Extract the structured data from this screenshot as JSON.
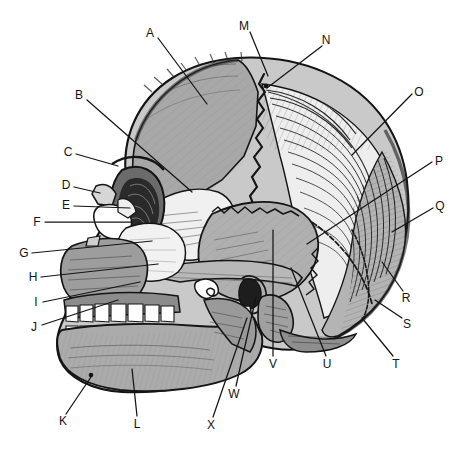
{
  "figure": {
    "background_color": "#ffffff",
    "line_color": "#141414",
    "label_font_size_px": 12,
    "palette": {
      "outline": "#141414",
      "dark_shade": "#6e6e6e",
      "mid_shade": "#a3a3a3",
      "light_shade": "#d8d8d8",
      "bone_white": "#f2f2f2",
      "tooth_white": "#ffffff",
      "cavity_black": "#1a1a1a"
    }
  },
  "labels": [
    {
      "id": "A",
      "text": "A",
      "x": 150,
      "y": 33,
      "tip_x": 207,
      "tip_y": 104,
      "side": "top-left",
      "part": "frontal-bone"
    },
    {
      "id": "B",
      "text": "B",
      "x": 79,
      "y": 95,
      "tip_x": 192,
      "tip_y": 192,
      "side": "left",
      "part": "sphenoid-greater-wing"
    },
    {
      "id": "C",
      "text": "C",
      "x": 68,
      "y": 152,
      "tip_x": 118,
      "tip_y": 166,
      "side": "left",
      "part": "supraorbital-margin"
    },
    {
      "id": "D",
      "text": "D",
      "x": 66,
      "y": 185,
      "tip_x": 100,
      "tip_y": 193,
      "side": "left",
      "part": "nasal-bone"
    },
    {
      "id": "E",
      "text": "E",
      "x": 66,
      "y": 205,
      "tip_x": 130,
      "tip_y": 208,
      "side": "left",
      "part": "lacrimal-bone"
    },
    {
      "id": "F",
      "text": "F",
      "x": 37,
      "y": 222,
      "tip_x": 131,
      "tip_y": 222,
      "side": "left",
      "part": "ethmoid-bone"
    },
    {
      "id": "G",
      "text": "G",
      "x": 24,
      "y": 253,
      "tip_x": 152,
      "tip_y": 241,
      "side": "left",
      "part": "anterior-nasal-spine"
    },
    {
      "id": "H",
      "text": "H",
      "x": 33,
      "y": 277,
      "tip_x": 158,
      "tip_y": 264,
      "side": "left",
      "part": "zygomatic-bone"
    },
    {
      "id": "I",
      "text": "I",
      "x": 36,
      "y": 302,
      "tip_x": 140,
      "tip_y": 282,
      "side": "left",
      "part": "maxilla"
    },
    {
      "id": "J",
      "text": "J",
      "x": 34,
      "y": 327,
      "tip_x": 118,
      "tip_y": 300,
      "side": "left",
      "part": "alveolar-process"
    },
    {
      "id": "K",
      "text": "K",
      "x": 63,
      "y": 421,
      "tip_x": 91,
      "tip_y": 375,
      "side": "bottom",
      "part": "mental-protuberance"
    },
    {
      "id": "L",
      "text": "L",
      "x": 137,
      "y": 424,
      "tip_x": 131,
      "tip_y": 369,
      "side": "bottom",
      "part": "body-of-mandible"
    },
    {
      "id": "M",
      "text": "M",
      "x": 244,
      "y": 26,
      "tip_x": 268,
      "tip_y": 75,
      "side": "top",
      "part": "coronal-suture"
    },
    {
      "id": "N",
      "text": "N",
      "x": 326,
      "y": 40,
      "tip_x": 266,
      "tip_y": 87,
      "side": "top",
      "part": "bregma"
    },
    {
      "id": "O",
      "text": "O",
      "x": 419,
      "y": 92,
      "tip_x": 352,
      "tip_y": 155,
      "side": "right",
      "part": "parietal-bone"
    },
    {
      "id": "P",
      "text": "P",
      "x": 439,
      "y": 161,
      "tip_x": 307,
      "tip_y": 244,
      "side": "right",
      "part": "squamous-suture"
    },
    {
      "id": "Q",
      "text": "Q",
      "x": 440,
      "y": 206,
      "tip_x": 390,
      "tip_y": 230,
      "side": "right",
      "part": "occipital-bone"
    },
    {
      "id": "R",
      "text": "R",
      "x": 406,
      "y": 298,
      "tip_x": 382,
      "tip_y": 262,
      "side": "right",
      "part": "lambdoid-suture"
    },
    {
      "id": "S",
      "text": "S",
      "x": 407,
      "y": 324,
      "tip_x": 376,
      "tip_y": 300,
      "side": "right",
      "part": "occipital-protuberance"
    },
    {
      "id": "T",
      "text": "T",
      "x": 396,
      "y": 364,
      "tip_x": 362,
      "tip_y": 318,
      "side": "bottom",
      "part": "occipital-condyle-region"
    },
    {
      "id": "U",
      "text": "U",
      "x": 327,
      "y": 364,
      "tip_x": 291,
      "tip_y": 267,
      "side": "bottom",
      "part": "mastoid-process"
    },
    {
      "id": "V",
      "text": "V",
      "x": 273,
      "y": 364,
      "tip_x": 273,
      "tip_y": 229,
      "side": "bottom",
      "part": "temporal-bone"
    },
    {
      "id": "W",
      "text": "W",
      "x": 234,
      "y": 394,
      "tip_x": 256,
      "tip_y": 296,
      "side": "bottom",
      "part": "styloid-process"
    },
    {
      "id": "X",
      "text": "X",
      "x": 211,
      "y": 425,
      "tip_x": 247,
      "tip_y": 318,
      "side": "bottom",
      "part": "ramus-of-mandible"
    }
  ]
}
